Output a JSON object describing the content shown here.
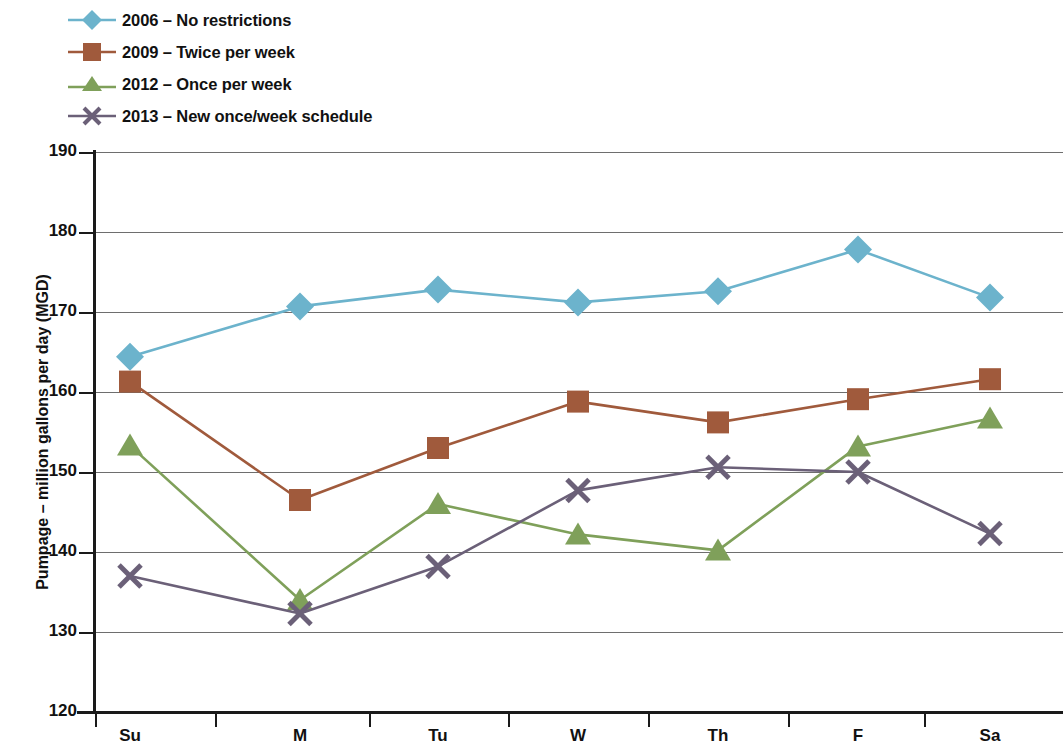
{
  "chart_data": {
    "type": "line",
    "title": "",
    "xlabel": "",
    "ylabel": "Pumpage – million gallons per day (MGD)",
    "categories": [
      "Su",
      "M",
      "Tu",
      "W",
      "Th",
      "F",
      "Sa"
    ],
    "ylim": [
      120,
      190
    ],
    "yticks": [
      120,
      130,
      140,
      150,
      160,
      170,
      180,
      190
    ],
    "grid": true,
    "legend_position": "above-plot-left",
    "series": [
      {
        "name": "2006 – No restrictions",
        "marker": "diamond",
        "color": "#6CB3CC",
        "values": [
          164.4,
          170.7,
          172.8,
          171.2,
          172.6,
          177.8,
          171.8
        ]
      },
      {
        "name": "2009 – Twice per week",
        "marker": "square",
        "color": "#A05A3C",
        "values": [
          161.3,
          146.5,
          153.0,
          158.8,
          156.2,
          159.1,
          161.6
        ]
      },
      {
        "name": "2012 – Once per week",
        "marker": "triangle",
        "color": "#7FA05A",
        "values": [
          153.3,
          134.0,
          146.0,
          142.2,
          140.2,
          153.2,
          156.7
        ]
      },
      {
        "name": "2013 – New once/week schedule",
        "marker": "x",
        "color": "#6B6078",
        "values": [
          137.0,
          132.3,
          138.2,
          147.7,
          150.6,
          150.0,
          142.3
        ]
      }
    ]
  }
}
